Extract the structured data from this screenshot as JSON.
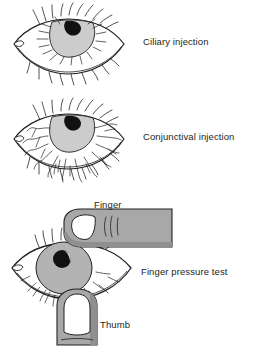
{
  "figure": {
    "background_color": "#ffffff",
    "line_color": "#231f20",
    "text_color": "#231f20",
    "iris_color": "#cccccc",
    "iris_color_dark": "#b3b3b3",
    "pupil_color": "#111111",
    "skin_color": "#a8a8a8",
    "skin_shadow_color": "#8f8f8f",
    "nail_color": "#ffffff",
    "sclera_color": "#ffffff"
  },
  "panels": [
    {
      "id": "ciliary",
      "label": "Ciliary injection",
      "description": "Eye with short straight radial vessels concentrated around the limbus",
      "vessel_style": "radial-straight"
    },
    {
      "id": "conjunctival",
      "label": "Conjunctival injection",
      "description": "Eye with long wavy branching vessels spreading over the conjunctiva",
      "vessel_style": "wavy-branching"
    },
    {
      "id": "pressure",
      "label": "Finger pressure test",
      "description": "Eye with index finger pressing from above and thumb from below",
      "vessel_style": "wavy-branching"
    }
  ],
  "annotations": {
    "finger": "Finger",
    "thumb": "Thumb"
  }
}
